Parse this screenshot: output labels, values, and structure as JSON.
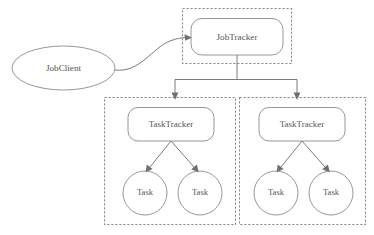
{
  "diagram": {
    "type": "node-link-diagram",
    "canvas": {
      "width": 374,
      "height": 235,
      "background": "#ffffff"
    },
    "style": {
      "shape_stroke": "#8b8b8b",
      "cluster_stroke": "#8b8b8b",
      "connector_stroke": "#7a7a7a",
      "label_color": "#555555",
      "cluster_line_style": "dashed"
    },
    "nodes": {
      "job_client": {
        "label": "JobClient",
        "shape": "ellipse",
        "cx": 63.5,
        "cy": 68,
        "rx": 51.5,
        "ry": 22
      },
      "job_tracker": {
        "label": "JobTracker",
        "shape": "rounded-rect",
        "x": 191,
        "y": 18,
        "width": 92,
        "height": 37,
        "radius": 11
      },
      "task_tracker_left": {
        "label": "TaskTracker",
        "shape": "rounded-rect",
        "x": 128,
        "y": 107,
        "width": 86,
        "height": 34,
        "radius": 10
      },
      "task_tracker_right": {
        "label": "TaskTracker",
        "shape": "rounded-rect",
        "x": 259,
        "y": 107,
        "width": 86,
        "height": 34,
        "radius": 10
      },
      "task_left_1": {
        "label": "Task",
        "shape": "circle",
        "cx": 145,
        "cy": 193,
        "r": 22
      },
      "task_left_2": {
        "label": "Task",
        "shape": "circle",
        "cx": 200,
        "cy": 193,
        "r": 22
      },
      "task_right_1": {
        "label": "Task",
        "shape": "circle",
        "cx": 276,
        "cy": 193,
        "r": 22
      },
      "task_right_2": {
        "label": "Task",
        "shape": "circle",
        "cx": 331,
        "cy": 193,
        "r": 22
      }
    },
    "clusters": {
      "job_tracker_node": {
        "name": "JobTracker node boundary",
        "x": 182,
        "y": 8,
        "width": 110,
        "height": 56
      },
      "task_tracker_node_left": {
        "name": "TaskTracker node boundary (left)",
        "x": 104,
        "y": 97,
        "width": 132,
        "height": 128
      },
      "task_tracker_node_right": {
        "name": "TaskTracker node boundary (right)",
        "x": 239,
        "y": 97,
        "width": 127,
        "height": 128
      }
    },
    "edges": [
      {
        "from": "job_client",
        "to": "job_tracker",
        "style": "curved",
        "arrow": true
      },
      {
        "from": "job_tracker",
        "to": "task_tracker_left",
        "style": "orthogonal",
        "arrow": true
      },
      {
        "from": "job_tracker",
        "to": "task_tracker_right",
        "style": "orthogonal",
        "arrow": true
      },
      {
        "from": "task_tracker_left",
        "to": "task_left_1",
        "style": "straight",
        "arrow": true
      },
      {
        "from": "task_tracker_left",
        "to": "task_left_2",
        "style": "straight",
        "arrow": true
      },
      {
        "from": "task_tracker_right",
        "to": "task_right_1",
        "style": "straight",
        "arrow": true
      },
      {
        "from": "task_tracker_right",
        "to": "task_right_2",
        "style": "straight",
        "arrow": true
      }
    ]
  }
}
